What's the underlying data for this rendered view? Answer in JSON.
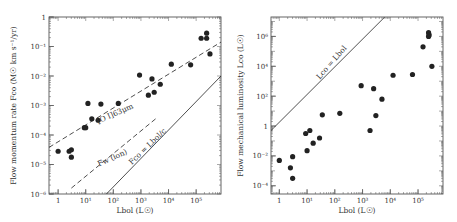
{
  "chart_data": [
    {
      "type": "scatter",
      "panel": "left",
      "xlabel": "Lbol (L☉)",
      "ylabel": "Flow momentum rate Fco (M☉ km s⁻¹/yr)",
      "xscale": "log",
      "yscale": "log",
      "xlim_log10": [
        -0.33,
        5.9
      ],
      "ylim_log10": [
        -6,
        0
      ],
      "xticks": [
        {
          "log": 0,
          "label": "1"
        },
        {
          "log": 1,
          "label": "10¹"
        },
        {
          "log": 2,
          "label": "10²"
        },
        {
          "log": 3,
          "label": "10³"
        },
        {
          "log": 4,
          "label": "10⁴"
        },
        {
          "log": 5,
          "label": "10⁵"
        }
      ],
      "yticks": [
        {
          "log": 0,
          "label": "1"
        },
        {
          "log": -1,
          "label": "10⁻¹"
        },
        {
          "log": -2,
          "label": "10⁻²"
        },
        {
          "log": -3,
          "label": "10⁻³"
        },
        {
          "log": -4,
          "label": "10⁻⁴"
        },
        {
          "log": -5,
          "label": "10⁻⁵"
        },
        {
          "log": -6,
          "label": "10⁻⁶"
        }
      ],
      "points_log10": [
        [
          0.0,
          -4.55
        ],
        [
          0.4,
          -4.55
        ],
        [
          0.48,
          -4.5
        ],
        [
          0.48,
          -4.75
        ],
        [
          0.95,
          -3.75
        ],
        [
          1.0,
          -3.75
        ],
        [
          1.08,
          -2.93
        ],
        [
          1.22,
          -3.45
        ],
        [
          1.45,
          -3.5
        ],
        [
          1.55,
          -2.95
        ],
        [
          2.18,
          -2.93
        ],
        [
          2.95,
          -1.97
        ],
        [
          3.27,
          -2.65
        ],
        [
          3.4,
          -2.1
        ],
        [
          3.48,
          -2.55
        ],
        [
          3.7,
          -2.28
        ],
        [
          4.1,
          -1.6
        ],
        [
          4.8,
          -1.62
        ],
        [
          5.18,
          -0.72
        ],
        [
          5.38,
          -0.72
        ],
        [
          5.38,
          -0.55
        ],
        [
          5.5,
          -1.25
        ]
      ],
      "lines": [
        {
          "name": "[O I]63μm",
          "style": "dashed",
          "from_log10": [
            -0.33,
            -4.42
          ],
          "to_log10": [
            5.9,
            -0.85
          ]
        },
        {
          "name": "Fw (ion)",
          "style": "dashed",
          "from_log10": [
            0.48,
            -5.8
          ],
          "to_log10": [
            3.6,
            -3.4
          ]
        },
        {
          "name": "Fco = Lbol/c",
          "style": "solid",
          "from_log10": [
            1.75,
            -6.0
          ],
          "to_log10": [
            5.9,
            -2.0
          ]
        }
      ],
      "annotations": [
        {
          "text": "[O I]63μm",
          "at_log10": [
            2.1,
            -3.35
          ],
          "rotate": -24
        },
        {
          "text": "Fw (ion)",
          "at_log10": [
            2.0,
            -4.85
          ],
          "rotate": -24
        },
        {
          "text": "Fco = Lbol/c",
          "at_log10": [
            3.3,
            -4.45
          ],
          "rotate": -44
        }
      ]
    },
    {
      "type": "scatter",
      "panel": "right",
      "xlabel": "Lbol (L☉)",
      "ylabel": "Flow mechanical luminosity Lco (L☉)",
      "xscale": "log",
      "yscale": "log",
      "xlim_log10": [
        -0.3,
        5.9
      ],
      "ylim_log10": [
        -4.55,
        7.3
      ],
      "xticks": [
        {
          "log": 0,
          "label": "1"
        },
        {
          "log": 1,
          "label": "10¹"
        },
        {
          "log": 2,
          "label": "10²"
        },
        {
          "log": 3,
          "label": "10³"
        },
        {
          "log": 4,
          "label": "10⁴"
        },
        {
          "log": 5,
          "label": "10⁵"
        }
      ],
      "yticks": [
        {
          "log": 6,
          "label": "10⁶"
        },
        {
          "log": 4,
          "label": "10⁴"
        },
        {
          "log": 2,
          "label": "10²"
        },
        {
          "log": 0,
          "label": "1"
        },
        {
          "log": -2,
          "label": "10⁻²"
        },
        {
          "log": -4,
          "label": "10⁻⁴"
        }
      ],
      "points_log10": [
        [
          0.0,
          -2.3
        ],
        [
          0.4,
          -2.8
        ],
        [
          0.48,
          -2.05
        ],
        [
          0.48,
          -3.5
        ],
        [
          0.95,
          -0.5
        ],
        [
          1.0,
          -1.65
        ],
        [
          1.1,
          -0.3
        ],
        [
          1.22,
          -1.15
        ],
        [
          1.45,
          -0.8
        ],
        [
          1.55,
          0.75
        ],
        [
          2.18,
          0.85
        ],
        [
          2.95,
          2.7
        ],
        [
          3.27,
          -0.3
        ],
        [
          3.4,
          2.5
        ],
        [
          3.48,
          0.7
        ],
        [
          3.7,
          1.8
        ],
        [
          4.1,
          3.4
        ],
        [
          4.8,
          3.45
        ],
        [
          5.18,
          5.3
        ],
        [
          5.38,
          6.0
        ],
        [
          5.38,
          6.25
        ],
        [
          5.5,
          4.0
        ],
        [
          5.4,
          6.1
        ]
      ],
      "lines": [
        {
          "name": "Lco = Lbol",
          "style": "solid",
          "from_log10": [
            -0.3,
            -0.3
          ],
          "to_log10": [
            3.8,
            7.3
          ]
        }
      ],
      "annotations": [
        {
          "text": "Lco = Lbol",
          "at_log10": [
            1.95,
            4.15
          ],
          "rotate": -49
        }
      ]
    }
  ],
  "panels": {
    "left": {
      "frame": {
        "x": 49,
        "y": 17,
        "w": 172,
        "h": 177
      },
      "ylabel_x": 16
    },
    "right": {
      "frame": {
        "x": 271,
        "y": 17,
        "w": 172,
        "h": 177
      },
      "ylabel_x": 243
    }
  },
  "colors": {
    "ink": "#222222",
    "frame": "#555555",
    "background": "#ffffff"
  }
}
